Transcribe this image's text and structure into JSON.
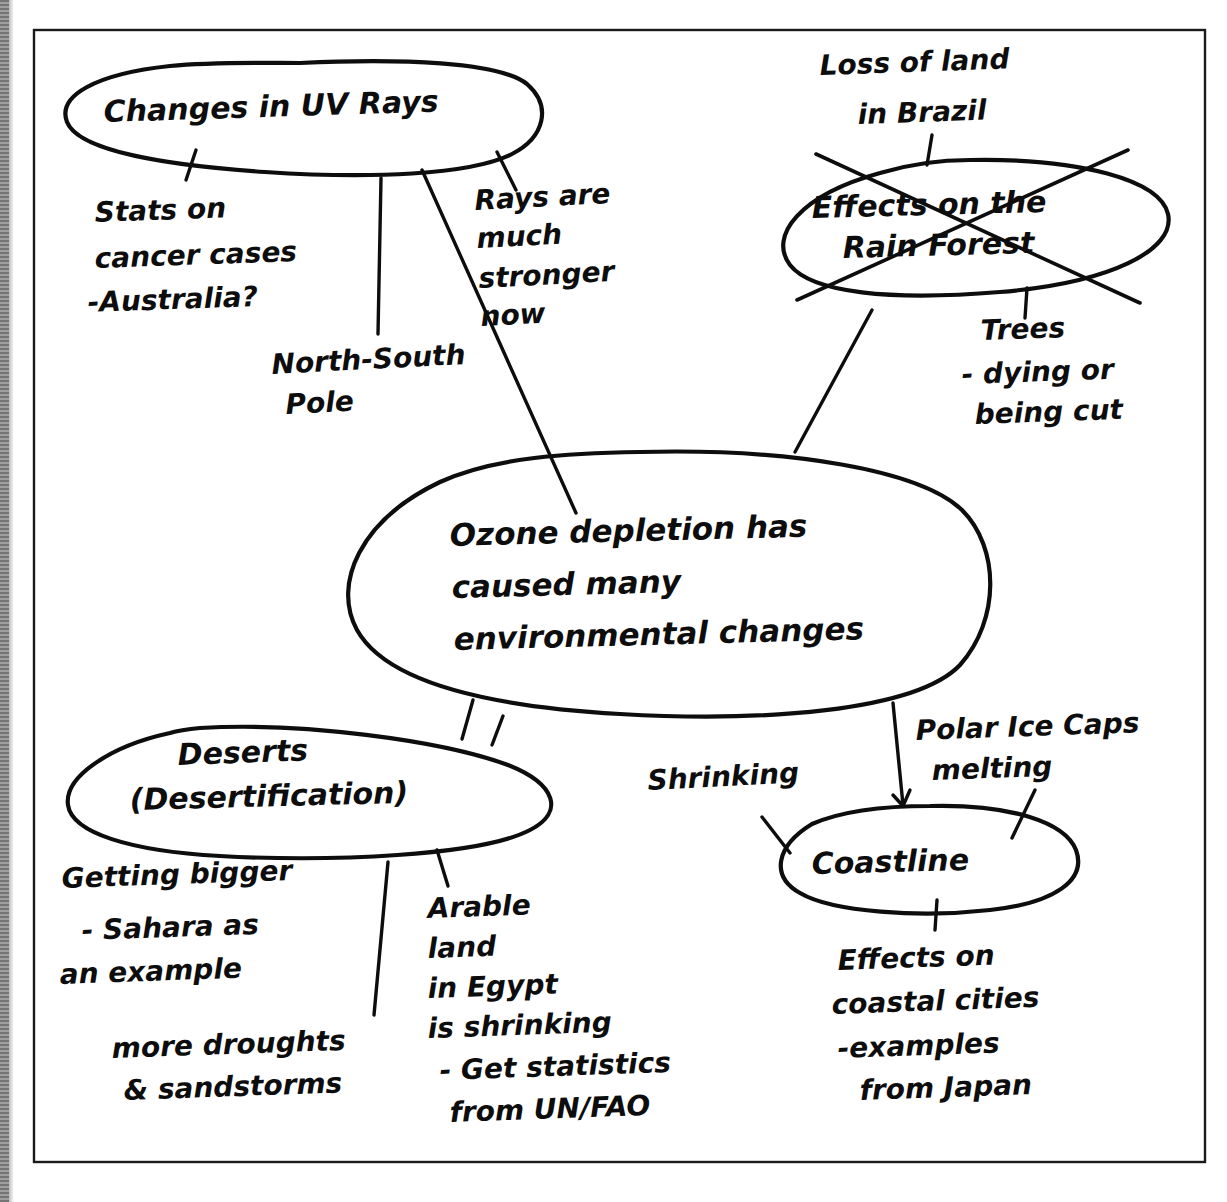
{
  "document": {
    "title": "Ozone depletion mind map",
    "type": "handwritten-mind-map"
  },
  "frame": {
    "border_color": "#1a1a1a"
  },
  "nodes": {
    "uv_rays": {
      "label": "Changes in UV Rays"
    },
    "rain_forest": {
      "label_line1": "Effects on the",
      "label_line2": "Rain Forest",
      "struck_out": true
    },
    "center": {
      "line1": "Ozone depletion has",
      "line2": "caused many",
      "line3": "environmental changes"
    },
    "deserts": {
      "label_line1": "Deserts",
      "label_line2": "(Desertification)"
    },
    "coastline": {
      "label": "Coastline"
    }
  },
  "notes": {
    "stats_cancer": {
      "line1": "Stats on",
      "line2": "cancer cases",
      "line3": "-Australia?"
    },
    "north_south_pole": {
      "line1": "North-South",
      "line2": "Pole"
    },
    "rays_stronger": {
      "line1": "Rays are",
      "line2": "much",
      "line3": "stronger",
      "line4": "now"
    },
    "loss_of_land": {
      "line1": "Loss of land",
      "line2": "in Brazil"
    },
    "trees": {
      "line1": "Trees",
      "line2": "- dying or",
      "line3": "being cut"
    },
    "getting_bigger": {
      "line1": "Getting bigger",
      "line2": "- Sahara as",
      "line3": "an example"
    },
    "droughts": {
      "line1": "more droughts",
      "line2": "& sandstorms"
    },
    "arable_land": {
      "line1": "Arable",
      "line2": "land",
      "line3": "in Egypt",
      "line4": "is shrinking",
      "line5": "- Get statistics",
      "line6": "from UN/FAO"
    },
    "shrinking": {
      "line1": "Shrinking"
    },
    "polar_ice": {
      "line1": "Polar Ice Caps",
      "line2": "melting"
    },
    "coastal_cities": {
      "line1": "Effects on",
      "line2": "coastal cities",
      "line3": "-examples",
      "line4": "from Japan"
    }
  }
}
